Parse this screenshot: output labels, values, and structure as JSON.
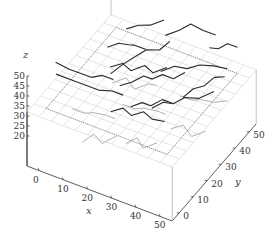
{
  "chart_data": {
    "type": "scatter",
    "subtype": "3d-line-network",
    "title": "",
    "xlabel": "x",
    "ylabel": "y",
    "zlabel": "z",
    "xlim": [
      -5,
      55
    ],
    "ylim": [
      -5,
      55
    ],
    "zlim": [
      5,
      32
    ],
    "z_axis_range": [
      20,
      50
    ],
    "xticks": [
      0,
      10,
      20,
      30,
      40,
      50
    ],
    "yticks": [
      0,
      10,
      20,
      30,
      40,
      50
    ],
    "zticks": [
      20,
      25,
      30,
      35,
      40,
      45,
      50
    ],
    "grid": true,
    "grid_plane_z": 32,
    "dotted_rectangle": {
      "x": [
        0,
        50
      ],
      "y": [
        0,
        50
      ]
    },
    "series": [
      {
        "name": "fibre network (above plane)",
        "color": "#2a2a2a",
        "lines": [
          [
            [
              -3,
              12,
              44
            ],
            [
              2,
              13,
              42
            ],
            [
              6,
              14,
              41
            ],
            [
              10,
              15,
              40
            ],
            [
              14,
              16,
              42
            ],
            [
              18,
              17,
              41
            ]
          ],
          [
            [
              -4,
              14,
              36
            ],
            [
              3,
              15,
              35
            ],
            [
              8,
              16,
              34
            ],
            [
              13,
              15,
              35
            ],
            [
              18,
              16,
              36
            ],
            [
              22,
              17,
              35
            ]
          ],
          [
            [
              8,
              30,
              42
            ],
            [
              12,
              31,
              45
            ],
            [
              15,
              33,
              44
            ],
            [
              18,
              32,
              46
            ],
            [
              22,
              33,
              45
            ]
          ],
          [
            [
              15,
              20,
              40
            ],
            [
              18,
              24,
              43
            ],
            [
              20,
              28,
              44
            ],
            [
              23,
              32,
              46
            ],
            [
              26,
              36,
              44
            ],
            [
              28,
              40,
              46
            ]
          ],
          [
            [
              20,
              18,
              38
            ],
            [
              24,
              20,
              40
            ],
            [
              27,
              23,
              42
            ],
            [
              30,
              24,
              41
            ],
            [
              33,
              26,
              43
            ],
            [
              37,
              27,
              42
            ],
            [
              40,
              30,
              44
            ]
          ],
          [
            [
              25,
              42,
              46
            ],
            [
              29,
              45,
              48
            ],
            [
              32,
              48,
              50
            ],
            [
              36,
              50,
              47
            ],
            [
              40,
              52,
              45
            ]
          ],
          [
            [
              30,
              30,
              40
            ],
            [
              34,
              33,
              42
            ],
            [
              38,
              35,
              41
            ],
            [
              42,
              37,
              43
            ],
            [
              46,
              40,
              42
            ],
            [
              50,
              43,
              40
            ]
          ],
          [
            [
              35,
              15,
              36
            ],
            [
              38,
              18,
              38
            ],
            [
              41,
              20,
              37
            ],
            [
              44,
              23,
              39
            ],
            [
              48,
              26,
              38
            ],
            [
              52,
              30,
              40
            ]
          ],
          [
            [
              10,
              40,
              44
            ],
            [
              14,
              42,
              46
            ],
            [
              17,
              45,
              45
            ],
            [
              21,
              48,
              47
            ]
          ],
          [
            [
              28,
              12,
              36
            ],
            [
              31,
              15,
              37
            ],
            [
              34,
              16,
              36
            ],
            [
              37,
              19,
              38
            ],
            [
              40,
              21,
              36
            ]
          ],
          [
            [
              42,
              44,
              46
            ],
            [
              44,
              47,
              44
            ],
            [
              46,
              50,
              45
            ],
            [
              49,
              52,
              43
            ]
          ],
          [
            [
              22,
              8,
              34
            ],
            [
              26,
              10,
              36
            ],
            [
              30,
              9,
              35
            ],
            [
              34,
              11,
              37
            ],
            [
              38,
              10,
              36
            ],
            [
              42,
              12,
              35
            ]
          ],
          [
            [
              45,
              20,
              42
            ],
            [
              47,
              24,
              44
            ],
            [
              49,
              28,
              43
            ],
            [
              51,
              32,
              45
            ],
            [
              53,
              36,
              43
            ]
          ],
          [
            [
              12,
              25,
              38
            ],
            [
              16,
              27,
              40
            ],
            [
              20,
              26,
              39
            ],
            [
              24,
              29,
              41
            ],
            [
              28,
              28,
              40
            ],
            [
              32,
              31,
              42
            ]
          ]
        ]
      },
      {
        "name": "fibre network (below plane)",
        "color": "#9a9a9a",
        "lines": [
          [
            [
              5,
              10,
              26
            ],
            [
              9,
              12,
              24
            ],
            [
              13,
              11,
              27
            ],
            [
              17,
              14,
              25
            ],
            [
              21,
              13,
              26
            ]
          ],
          [
            [
              20,
              20,
              27
            ],
            [
              24,
              22,
              25
            ],
            [
              28,
              21,
              28
            ],
            [
              32,
              24,
              26
            ],
            [
              36,
              23,
              27
            ]
          ],
          [
            [
              10,
              30,
              25
            ],
            [
              14,
              33,
              27
            ],
            [
              18,
              32,
              24
            ],
            [
              22,
              35,
              26
            ],
            [
              26,
              34,
              28
            ]
          ],
          [
            [
              30,
              5,
              24
            ],
            [
              33,
              8,
              26
            ],
            [
              36,
              7,
              23
            ],
            [
              40,
              10,
              25
            ]
          ],
          [
            [
              35,
              35,
              26
            ],
            [
              39,
              37,
              24
            ],
            [
              43,
              36,
              27
            ],
            [
              47,
              39,
              25
            ],
            [
              51,
              41,
              26
            ]
          ],
          [
            [
              15,
              0,
              22
            ],
            [
              18,
              3,
              25
            ],
            [
              22,
              2,
              23
            ],
            [
              26,
              5,
              26
            ]
          ],
          [
            [
              40,
              20,
              24
            ],
            [
              44,
              22,
              26
            ],
            [
              48,
              21,
              23
            ],
            [
              52,
              24,
              25
            ]
          ]
        ]
      }
    ]
  }
}
